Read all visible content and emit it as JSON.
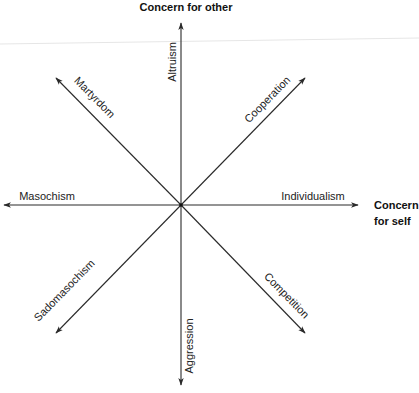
{
  "diagram": {
    "type": "radial-axes",
    "center": {
      "x": 181,
      "y": 205
    },
    "titles": {
      "vertical": "Concern for other",
      "horizontal_line1": "Concern",
      "horizontal_line2": "for self"
    },
    "axes": [
      {
        "id": "altruism",
        "label": "Altruism",
        "direction": "up"
      },
      {
        "id": "cooperation",
        "label": "Cooperation",
        "direction": "up-right"
      },
      {
        "id": "individualism",
        "label": "Individualism",
        "direction": "right"
      },
      {
        "id": "competition",
        "label": "Competition",
        "direction": "down-right"
      },
      {
        "id": "aggression",
        "label": "Aggression",
        "direction": "down"
      },
      {
        "id": "sadomasochism",
        "label": "Sadomasochism",
        "direction": "down-left"
      },
      {
        "id": "masochism",
        "label": "Masochism",
        "direction": "left"
      },
      {
        "id": "martyrdom",
        "label": "Martyrdom",
        "direction": "up-left"
      }
    ],
    "colors": {
      "line": "#2a2a2a",
      "text": "#222222",
      "background": "#ffffff"
    }
  }
}
